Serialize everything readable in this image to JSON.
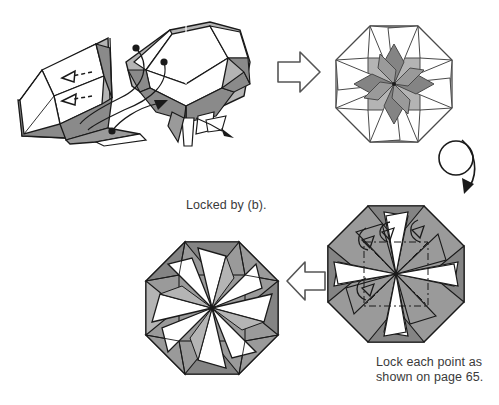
{
  "page": {
    "kind": "origami-instruction-diagram",
    "background_color": "#ffffff",
    "width": 499,
    "height": 405
  },
  "captions": {
    "locked_by": "Locked by (b).",
    "lock_each_point_line1": "Lock each point as",
    "lock_each_point_line2": "shown on page 65."
  },
  "palette": {
    "ink": "#1a1a1a",
    "paper_white": "#ffffff",
    "gray_light": "#b4b4b4",
    "gray_mid": "#9a9a9a",
    "gray_dark": "#848484",
    "gray_darker": "#6e6e6e",
    "text": "#3a3a3a"
  },
  "steps": [
    {
      "id": "step-3d-assembly",
      "label": "two folded units being joined",
      "position": "top-left"
    },
    {
      "id": "step-octagon-pinwheel",
      "label": "assembled octagonal pinwheel star",
      "position": "top-right"
    },
    {
      "id": "step-octagon-locking",
      "label": "octagon with points being locked",
      "position": "bottom-right"
    },
    {
      "id": "step-octagon-finished",
      "label": "finished locked octagonal star",
      "position": "bottom-left"
    }
  ],
  "arrows": [
    {
      "id": "arrow-hollow-right",
      "type": "hollow-block-arrow",
      "direction": "right"
    },
    {
      "id": "arrow-turn-over",
      "type": "loop-turnover-arrow",
      "direction": "clockwise-down"
    },
    {
      "id": "arrow-hollow-left",
      "type": "hollow-block-arrow",
      "direction": "left"
    },
    {
      "id": "arrow-tuck-upper",
      "type": "dashed-push-arrow",
      "direction": "left"
    },
    {
      "id": "arrow-tuck-lower",
      "type": "dashed-push-arrow",
      "direction": "left"
    },
    {
      "id": "arrow-locator-upper",
      "type": "curved-locator-arrow"
    },
    {
      "id": "arrow-locator-lower",
      "type": "curved-locator-arrow"
    },
    {
      "id": "arrow-spread-right",
      "type": "thin-straight-arrow",
      "direction": "right-down"
    }
  ]
}
